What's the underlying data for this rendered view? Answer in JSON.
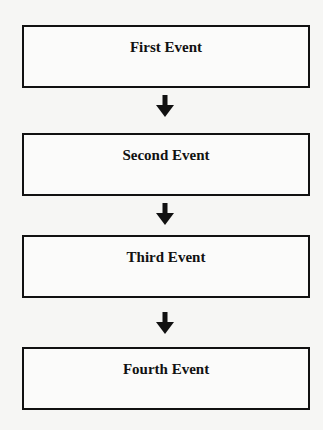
{
  "diagram": {
    "type": "flowchart",
    "direction": "top-to-bottom",
    "nodes": [
      {
        "id": "first",
        "label": "First Event"
      },
      {
        "id": "second",
        "label": "Second Event"
      },
      {
        "id": "third",
        "label": "Third Event"
      },
      {
        "id": "fourth",
        "label": "Fourth Event"
      }
    ],
    "edges": [
      {
        "from": "first",
        "to": "second",
        "icon": "down-arrow-icon"
      },
      {
        "from": "second",
        "to": "third",
        "icon": "down-arrow-icon"
      },
      {
        "from": "third",
        "to": "fourth",
        "icon": "down-arrow-icon"
      }
    ],
    "colors": {
      "stroke": "#111111",
      "background": "#f6f6f4"
    }
  }
}
